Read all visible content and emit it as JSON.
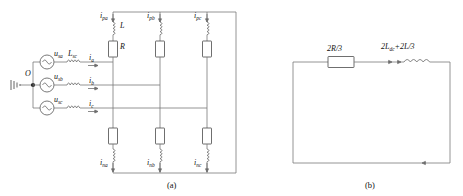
{
  "figure": {
    "panels": [
      {
        "id": "a",
        "caption": "(a)",
        "name": "three-phase-source-bridge-circuit",
        "ground_node_label": "O",
        "sources": [
          {
            "label": "u",
            "sub": "sa",
            "icon": "ac-source-icon"
          },
          {
            "label": "u",
            "sub": "sb",
            "icon": "ac-source-icon"
          },
          {
            "label": "u",
            "sub": "sc",
            "icon": "ac-source-icon"
          }
        ],
        "line_inductor_label": {
          "base": "L",
          "sub": "sc"
        },
        "line_currents": [
          {
            "base": "i",
            "sub": "a"
          },
          {
            "base": "i",
            "sub": "b"
          },
          {
            "base": "i",
            "sub": "c"
          }
        ],
        "upper_branch_currents": [
          {
            "base": "i",
            "sub": "pa"
          },
          {
            "base": "i",
            "sub": "pb"
          },
          {
            "base": "i",
            "sub": "pc"
          }
        ],
        "lower_branch_currents": [
          {
            "base": "i",
            "sub": "na"
          },
          {
            "base": "i",
            "sub": "nb"
          },
          {
            "base": "i",
            "sub": "nc"
          }
        ],
        "branch_inductor_label": "L",
        "branch_resistor_label": "R"
      },
      {
        "id": "b",
        "caption": "(b)",
        "name": "equivalent-loop-circuit",
        "resistor_label": "2R/3",
        "inductor_label": {
          "pre": "2L",
          "sub": "dc",
          "post": "+2L/3"
        }
      }
    ]
  },
  "colors": {
    "wire": "#7a7a7a",
    "device": "#4a4a4a",
    "text": "#111111",
    "background": "#ffffff"
  }
}
